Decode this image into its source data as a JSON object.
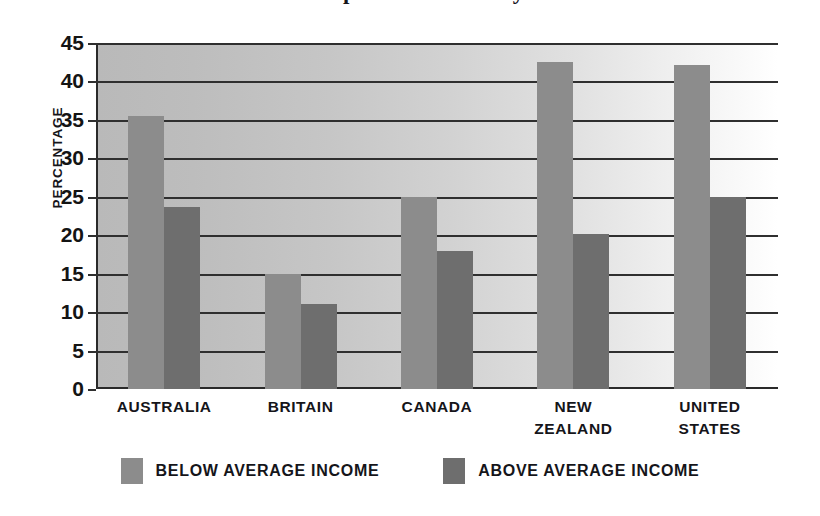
{
  "title": "Comparison of Poverty",
  "chart_data": {
    "type": "bar",
    "title": "Comparison of Poverty",
    "xlabel": "",
    "ylabel": "PERCENTAGE",
    "ylim": [
      0,
      45
    ],
    "yticks": [
      0,
      5,
      10,
      15,
      20,
      25,
      30,
      35,
      40,
      45
    ],
    "ytick_labels": [
      "0",
      "5",
      "10",
      "15",
      "20",
      "25",
      "30",
      "35",
      "40",
      "45"
    ],
    "grid": true,
    "legend_position": "bottom",
    "categories": [
      "AUSTRALIA",
      "BRITAIN",
      "CANADA",
      "NEW ZEALAND",
      "UNITED STATES"
    ],
    "category_lines": [
      [
        "AUSTRALIA"
      ],
      [
        "BRITAIN"
      ],
      [
        "CANADA"
      ],
      [
        "NEW",
        "ZEALAND"
      ],
      [
        "UNITED",
        "STATES"
      ]
    ],
    "series": [
      {
        "name": "BELOW AVERAGE INCOME",
        "color": "#8c8c8c",
        "values": [
          35.5,
          15.0,
          25.0,
          42.5,
          42.2
        ]
      },
      {
        "name": "ABOVE AVERAGE INCOME",
        "color": "#6e6e6e",
        "values": [
          23.7,
          11.1,
          18.0,
          20.2,
          25.0
        ]
      }
    ]
  },
  "legend": {
    "items": [
      {
        "label": "BELOW AVERAGE INCOME",
        "color": "#8c8c8c"
      },
      {
        "label": "ABOVE AVERAGE INCOME",
        "color": "#6e6e6e"
      }
    ]
  },
  "axis": {
    "y_title": "PERCENTAGE"
  },
  "colors": {
    "below_average": "#8c8c8c",
    "above_average": "#6e6e6e",
    "axis": "#2f2f2f",
    "plot_bg_left": "#b9b9b9",
    "plot_bg_right": "#ffffff"
  }
}
